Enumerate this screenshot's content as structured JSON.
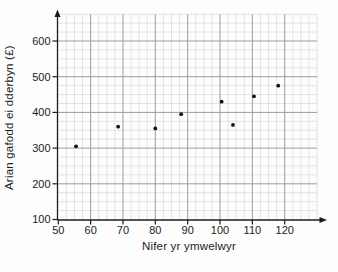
{
  "chart_data": {
    "type": "scatter",
    "title": "",
    "xlabel": "Nifer yr ymwelwyr",
    "ylabel": "Arian gafodd ei dderbyn (£)",
    "x_ticks": [
      50,
      60,
      70,
      80,
      90,
      100,
      110,
      120
    ],
    "y_ticks": [
      100,
      200,
      300,
      400,
      500,
      600
    ],
    "xlim": [
      50,
      130
    ],
    "ylim": [
      100,
      675
    ],
    "x_minor_step": 2.5,
    "y_minor_step": 25,
    "grid": "minor+major",
    "legend": "none",
    "points": [
      {
        "x": 55.5,
        "y": 305
      },
      {
        "x": 68.5,
        "y": 360
      },
      {
        "x": 80,
        "y": 355
      },
      {
        "x": 88,
        "y": 395
      },
      {
        "x": 100.5,
        "y": 430
      },
      {
        "x": 104,
        "y": 365
      },
      {
        "x": 110.5,
        "y": 445
      },
      {
        "x": 118,
        "y": 475
      }
    ],
    "colors": {
      "point": "#111111",
      "axis": "#1c1c1c",
      "grid_minor": "#d9d9d9",
      "grid_major": "#9c9c9c",
      "text": "#1c1c1c"
    }
  }
}
